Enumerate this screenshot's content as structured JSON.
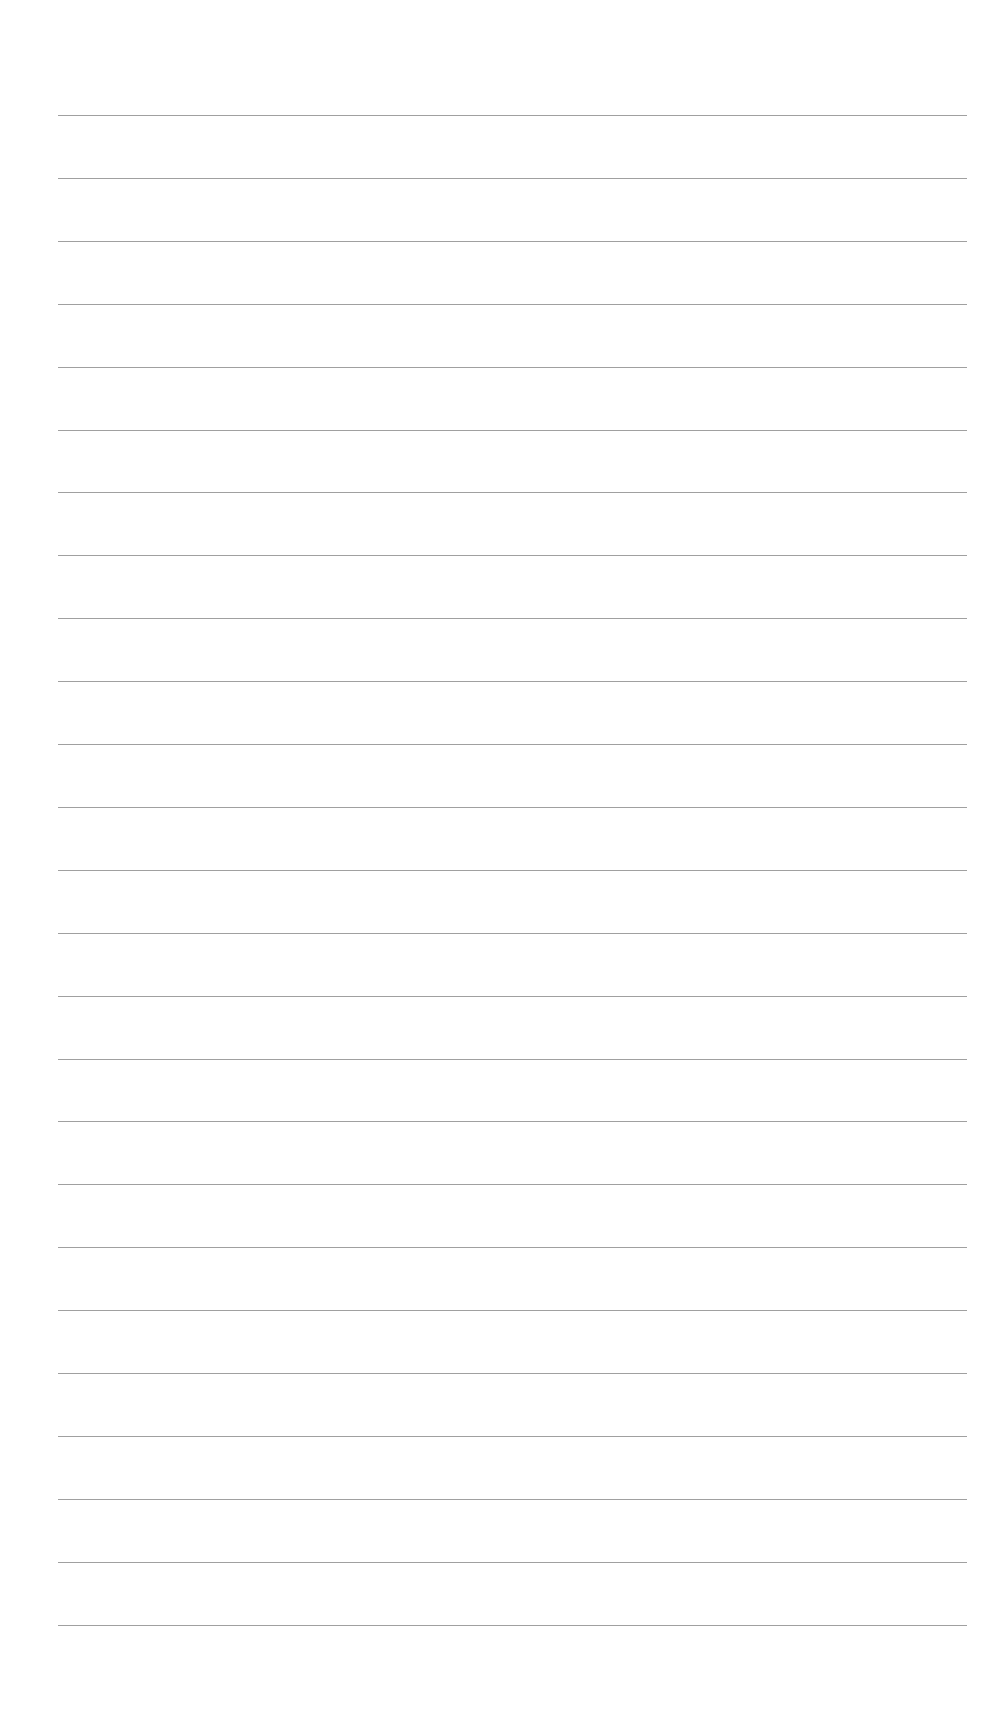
{
  "page": {
    "type": "ruled-paper",
    "background_color": "#ffffff",
    "line_color": "#8f8f8f",
    "line_count": 25,
    "first_line_y": 115,
    "line_spacing": 62.9,
    "line_left_x": 58,
    "line_width": 909,
    "lines": [
      {
        "index": 1,
        "text": ""
      },
      {
        "index": 2,
        "text": ""
      },
      {
        "index": 3,
        "text": ""
      },
      {
        "index": 4,
        "text": ""
      },
      {
        "index": 5,
        "text": ""
      },
      {
        "index": 6,
        "text": ""
      },
      {
        "index": 7,
        "text": ""
      },
      {
        "index": 8,
        "text": ""
      },
      {
        "index": 9,
        "text": ""
      },
      {
        "index": 10,
        "text": ""
      },
      {
        "index": 11,
        "text": ""
      },
      {
        "index": 12,
        "text": ""
      },
      {
        "index": 13,
        "text": ""
      },
      {
        "index": 14,
        "text": ""
      },
      {
        "index": 15,
        "text": ""
      },
      {
        "index": 16,
        "text": ""
      },
      {
        "index": 17,
        "text": ""
      },
      {
        "index": 18,
        "text": ""
      },
      {
        "index": 19,
        "text": ""
      },
      {
        "index": 20,
        "text": ""
      },
      {
        "index": 21,
        "text": ""
      },
      {
        "index": 22,
        "text": ""
      },
      {
        "index": 23,
        "text": ""
      },
      {
        "index": 24,
        "text": ""
      },
      {
        "index": 25,
        "text": ""
      }
    ]
  }
}
